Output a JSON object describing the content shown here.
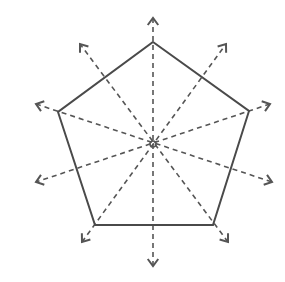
{
  "diagram": {
    "title": "Regular pentagon with lines of symmetry",
    "shape": "regular-pentagon",
    "line_color": "#4a4a4a",
    "dash_color": "#555555",
    "center": {
      "x": 153,
      "y": 144
    },
    "vertices": [
      {
        "name": "top",
        "x": 153,
        "y": 42
      },
      {
        "name": "right",
        "x": 249,
        "y": 111
      },
      {
        "name": "bottom-right",
        "x": 213,
        "y": 225
      },
      {
        "name": "bottom-left",
        "x": 95,
        "y": 225
      },
      {
        "name": "left",
        "x": 58,
        "y": 112
      }
    ],
    "symmetry_lines": [
      {
        "from": {
          "x": 153,
          "y": 18
        },
        "to": {
          "x": 153,
          "y": 266
        }
      },
      {
        "from": {
          "x": 270,
          "y": 104
        },
        "to": {
          "x": 36,
          "y": 182
        }
      },
      {
        "from": {
          "x": 228,
          "y": 242
        },
        "to": {
          "x": 80,
          "y": 44
        }
      },
      {
        "from": {
          "x": 82,
          "y": 242
        },
        "to": {
          "x": 226,
          "y": 44
        }
      },
      {
        "from": {
          "x": 36,
          "y": 104
        },
        "to": {
          "x": 272,
          "y": 182
        }
      }
    ],
    "symmetry_line_count": 5
  }
}
